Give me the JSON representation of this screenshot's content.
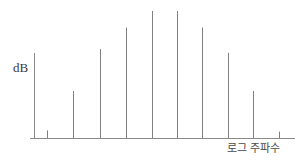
{
  "figure": {
    "background_color": "#ffffff",
    "line_color": "#808080",
    "axis_color": "#8a8a8a",
    "text_color": "#3a3a3a"
  },
  "labels": {
    "y_axis": "dB",
    "x_axis": "로그 주파수"
  },
  "chart_data": {
    "type": "bar",
    "title": "",
    "subtitle": "",
    "xlabel": "로그 주파수",
    "ylabel": "dB",
    "grid": false,
    "legend": null,
    "axis": {
      "x_start_px": 34,
      "x_end_px": 295,
      "baseline_y_px": 138,
      "y_top_px": 53
    },
    "xlim": [
      0,
      10.5
    ],
    "ylim": [
      0,
      100
    ],
    "categories": [
      "f1",
      "f2",
      "f3",
      "f4",
      "f5",
      "f6",
      "f7",
      "f8",
      "f9",
      "f10"
    ],
    "x": [
      0.5,
      1.5,
      2.5,
      3.5,
      4.5,
      5.5,
      6.5,
      7.5,
      8.5,
      9.5
    ],
    "values": [
      6,
      37,
      70,
      87,
      100,
      100,
      87,
      67,
      37,
      5
    ],
    "tick_marks_px": [
      47,
      73,
      100,
      126,
      152,
      177,
      202,
      228,
      253,
      279
    ],
    "bar_width_px": 1,
    "annotations": []
  }
}
